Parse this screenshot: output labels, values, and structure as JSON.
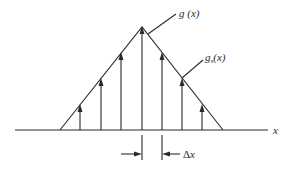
{
  "diagram": {
    "labels": {
      "continuous_function": "g (x)",
      "sampled_function_base": "g",
      "sampled_function_sub": "s",
      "sampled_function_arg": "(x)",
      "axis": "x",
      "spacing_symbol": "Δ",
      "spacing_var": "x"
    },
    "geometry": {
      "axis": {
        "x1": 15,
        "x2": 268,
        "y": 130
      },
      "triangle": {
        "left": [
          60,
          130
        ],
        "apex": [
          142,
          27
        ],
        "right": [
          223,
          130
        ]
      },
      "sample_x": [
        80,
        101,
        121,
        142,
        162,
        182,
        202
      ],
      "spacing_markers": [
        142,
        162
      ]
    },
    "colors": {
      "line": "#2a2a2a",
      "background": "#ffffff"
    }
  }
}
